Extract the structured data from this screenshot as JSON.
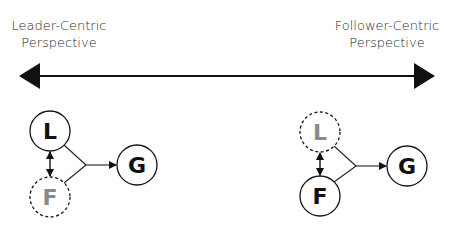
{
  "spectrum": {
    "left_label_line1": "Leader-Centric",
    "left_label_line2": "Perspective",
    "right_label_line1": "Follower-Centric",
    "right_label_line2": "Perspective"
  },
  "left_diagram": {
    "leader": {
      "letter": "L",
      "style": "solid"
    },
    "follower": {
      "letter": "F",
      "style": "dashed"
    },
    "goal": {
      "letter": "G",
      "style": "solid"
    }
  },
  "right_diagram": {
    "leader": {
      "letter": "L",
      "style": "dashed"
    },
    "follower": {
      "letter": "F",
      "style": "solid"
    },
    "goal": {
      "letter": "G",
      "style": "solid"
    }
  },
  "colors": {
    "primary": "#111111",
    "faded": "#8a8a8a",
    "line": "#222222"
  }
}
